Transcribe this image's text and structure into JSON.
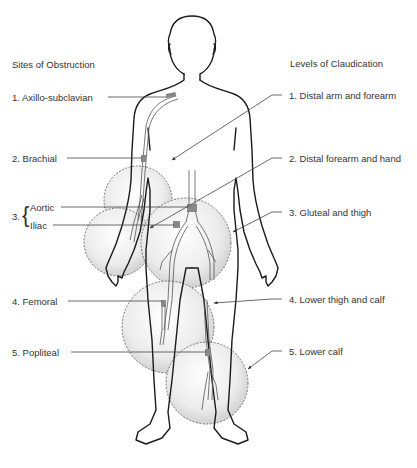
{
  "left_column": {
    "heading": "Sites of Obstruction",
    "items": [
      {
        "number": "1.",
        "label": "1. Axillo-subclavian"
      },
      {
        "number": "2.",
        "label": "2. Brachial"
      },
      {
        "number": "3.",
        "label": "3.",
        "sub": [
          "Aortic",
          "Iliac"
        ]
      },
      {
        "number": "4.",
        "label": "4. Femoral"
      },
      {
        "number": "5.",
        "label": "5. Popliteal"
      }
    ]
  },
  "right_column": {
    "heading": "Levels of Claudication",
    "items": [
      {
        "label": "1. Distal arm and forearm"
      },
      {
        "label": "2. Distal forearm and hand"
      },
      {
        "label": "3. Gluteal and thigh"
      },
      {
        "label": "4. Lower thigh and calf"
      },
      {
        "label": "5. Lower calf"
      }
    ]
  },
  "brace_glyph": "{",
  "colors": {
    "outline": "#1a1a1a",
    "leader": "#444444",
    "circle_edge": "#555555",
    "circle_fill_center": "#ffffff",
    "circle_fill_edge": "#d4d4d4",
    "obstruction": "#888888",
    "text": "#333333"
  }
}
